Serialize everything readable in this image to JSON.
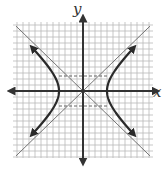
{
  "diagram": {
    "type": "hyperbola-graph",
    "axes": {
      "x_label": "x",
      "y_label": "y"
    },
    "grid": {
      "cell_px": 6,
      "cols": 23,
      "rows": 22
    },
    "hyperbola": {
      "orientation": "horizontal",
      "a": 4,
      "b": 2.5,
      "center": [
        0,
        0
      ]
    },
    "colors": {
      "grid": "#b9b9b9",
      "axis": "#333333",
      "curve": "#2a2a2a",
      "asymptote": "#666666",
      "dashed": "#555555"
    }
  }
}
